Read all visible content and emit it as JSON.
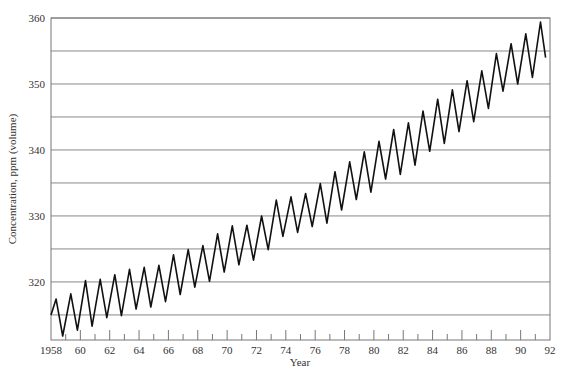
{
  "chart_data": {
    "type": "line",
    "title": "",
    "xlabel": "Year",
    "ylabel": "Concentration, ppm (volume)",
    "xlim": [
      1958,
      1992
    ],
    "ylim": [
      311.2,
      360
    ],
    "x_tick_labels": [
      "1958",
      "60",
      "62",
      "64",
      "66",
      "68",
      "70",
      "72",
      "74",
      "76",
      "78",
      "80",
      "82",
      "84",
      "86",
      "88",
      "90",
      "92"
    ],
    "x_ticks": [
      1958,
      1960,
      1962,
      1964,
      1966,
      1968,
      1970,
      1972,
      1974,
      1976,
      1978,
      1980,
      1982,
      1984,
      1986,
      1988,
      1990,
      1992
    ],
    "y_tick_labels": [
      "320",
      "330",
      "340",
      "350",
      "360"
    ],
    "y_ticks": [
      320,
      330,
      340,
      350,
      360
    ],
    "y_gridlines": [
      315,
      320,
      325,
      330,
      335,
      340,
      345,
      350,
      355,
      360
    ],
    "grid": "horizontal",
    "legend": null,
    "series": [
      {
        "name": "CO2 concentration",
        "x": [
          1958.0,
          1958.35,
          1958.8,
          1959.35,
          1959.8,
          1960.35,
          1960.8,
          1961.35,
          1961.8,
          1962.35,
          1962.8,
          1963.35,
          1963.8,
          1964.35,
          1964.8,
          1965.35,
          1965.8,
          1966.35,
          1966.8,
          1967.35,
          1967.8,
          1968.35,
          1968.8,
          1969.35,
          1969.8,
          1970.35,
          1970.8,
          1971.35,
          1971.8,
          1972.35,
          1972.8,
          1973.35,
          1973.8,
          1974.35,
          1974.8,
          1975.35,
          1975.8,
          1976.35,
          1976.8,
          1977.35,
          1977.8,
          1978.35,
          1978.8,
          1979.35,
          1979.8,
          1980.35,
          1980.8,
          1981.35,
          1981.8,
          1982.35,
          1982.8,
          1983.35,
          1983.8,
          1984.35,
          1984.8,
          1985.35,
          1985.8,
          1986.35,
          1986.8,
          1987.35,
          1987.8,
          1988.35,
          1988.8,
          1989.35,
          1989.8,
          1990.35,
          1990.8,
          1991.35,
          1991.7
        ],
        "y": [
          315.0,
          317.4,
          311.8,
          318.2,
          312.7,
          320.2,
          313.3,
          320.4,
          314.6,
          321.1,
          314.9,
          321.9,
          315.9,
          322.2,
          316.2,
          322.5,
          317.0,
          324.1,
          318.1,
          324.9,
          319.2,
          325.5,
          320.1,
          327.3,
          321.5,
          328.5,
          322.6,
          328.6,
          323.3,
          330.0,
          324.9,
          332.4,
          326.9,
          332.9,
          327.5,
          333.4,
          328.4,
          334.9,
          328.9,
          336.7,
          330.9,
          338.2,
          332.5,
          339.7,
          333.6,
          341.3,
          335.6,
          343.1,
          336.3,
          344.1,
          337.7,
          345.9,
          339.8,
          347.7,
          341.0,
          349.1,
          342.8,
          350.5,
          344.3,
          352.0,
          346.3,
          354.6,
          348.9,
          356.1,
          350.0,
          357.6,
          351.0,
          359.4,
          354.0
        ]
      }
    ]
  }
}
